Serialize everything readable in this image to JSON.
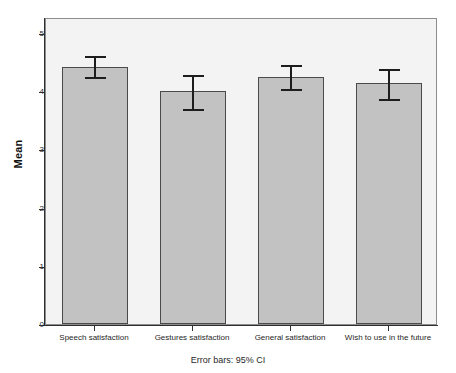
{
  "chart_data": {
    "type": "bar",
    "title": "",
    "subtitle": "",
    "xlabel": "",
    "ylabel": "Mean",
    "ylim": [
      0,
      5
    ],
    "yticks": [
      0,
      1,
      2,
      3,
      4,
      5
    ],
    "ytick_labels": [
      "0",
      "1",
      "2",
      "3",
      "4",
      "5"
    ],
    "grid": false,
    "legend": null,
    "annotation": "Error bars: 95% CI",
    "error_bar_type": "95% CI",
    "categories": [
      "Speech satisfaction",
      "Gestures satisfaction",
      "General satisfaction",
      "Wish to use in the future"
    ],
    "values": [
      4.42,
      4.0,
      4.24,
      4.14
    ],
    "ci_lower": [
      4.24,
      3.69,
      4.04,
      3.87
    ],
    "ci_upper": [
      4.64,
      4.31,
      4.48,
      4.42
    ],
    "series": [
      {
        "name": "Mean",
        "values": [
          4.42,
          4.0,
          4.24,
          4.14
        ]
      }
    ],
    "colors": {
      "bar_fill": "#c2c2c2",
      "bar_border": "#4a4a4a",
      "error_bar": "#1d1d1d",
      "plot_background": "#f3f3f3",
      "axis": "#2e2e2e",
      "figure_background": "#ffffff"
    }
  },
  "axis": {
    "y_title": "Mean",
    "tick_0": "0",
    "tick_1": "1",
    "tick_2": "2",
    "tick_3": "3",
    "tick_4": "4",
    "tick_5": "5"
  },
  "categories": {
    "c0": "Speech satisfaction",
    "c1": "Gestures satisfaction",
    "c2": "General satisfaction",
    "c3": "Wish to use in the future"
  },
  "footnote": "Error bars: 95% CI"
}
